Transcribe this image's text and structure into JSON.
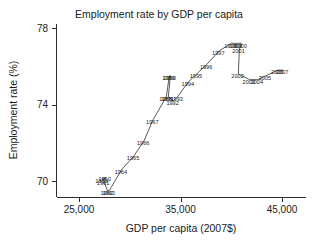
{
  "chart_data": {
    "type": "line",
    "title": "Employment rate by GDP per capita",
    "xlabel": "GDP per capita (2007$)",
    "ylabel": "Employment rate (%)",
    "xlim": [
      24000,
      47000
    ],
    "ylim": [
      69.0,
      78.6
    ],
    "xticks": [
      25000,
      35000,
      45000
    ],
    "xticklabels": [
      "25,000",
      "35,000",
      "45,000"
    ],
    "yticks": [
      70,
      74,
      78
    ],
    "yticklabels": [
      "70",
      "74",
      "78"
    ],
    "grid": false,
    "legend": "none",
    "series": [
      {
        "name": "United States",
        "point_labels": [
          "1959",
          "1960",
          "1961",
          "1962",
          "1963",
          "1964",
          "1965",
          "1966",
          "1967",
          "1988",
          "1989",
          "1990",
          "1991",
          "1992",
          "1993",
          "1994",
          "1995",
          "1996",
          "1997",
          "1998",
          "1999",
          "2000",
          "2001",
          "2002",
          "2003",
          "2004",
          "2005",
          "2006",
          "2007"
        ],
        "x": [
          27300,
          27600,
          27450,
          27800,
          28000,
          29200,
          30400,
          31400,
          32300,
          33600,
          33900,
          34000,
          33800,
          34300,
          34700,
          35800,
          36600,
          37600,
          38800,
          40000,
          40500,
          41000,
          40800,
          40700,
          41800,
          42600,
          43400,
          44600,
          45100
        ],
        "y": [
          70.1,
          70.2,
          70.0,
          69.5,
          69.5,
          70.6,
          71.3,
          72.1,
          73.2,
          74.4,
          75.5,
          75.5,
          74.4,
          74.2,
          74.4,
          75.2,
          75.6,
          76.1,
          76.8,
          77.2,
          77.2,
          77.2,
          76.9,
          75.6,
          75.3,
          75.3,
          75.5,
          75.8,
          75.8
        ]
      }
    ]
  },
  "labels": {
    "title": "Employment rate by GDP per capita",
    "xlabel": "GDP per capita (2007$)",
    "ylabel": "Employment rate (%)"
  }
}
